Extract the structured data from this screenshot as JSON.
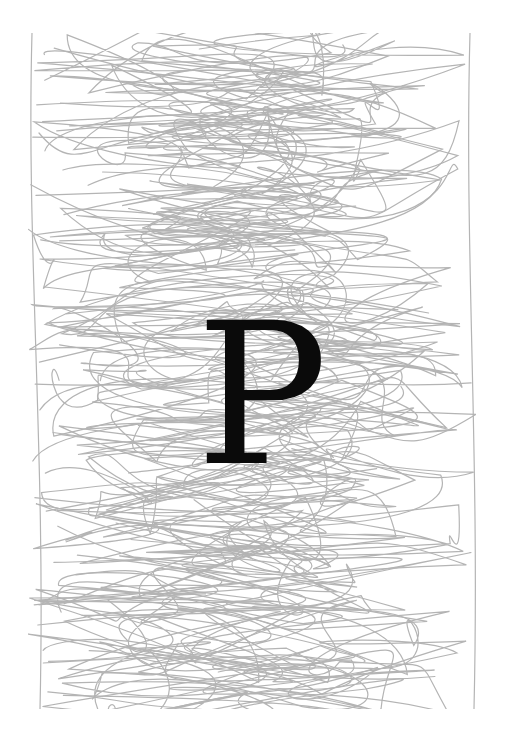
{
  "artwork": {
    "letter": "P",
    "letter_color": "#0a0a0a",
    "scribble_color": "#b4b4b4",
    "background_color": "#ffffff"
  }
}
